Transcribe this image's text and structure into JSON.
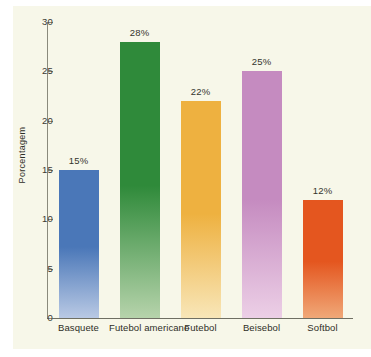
{
  "chart_data": {
    "type": "bar",
    "title": "",
    "subtitle": "",
    "xlabel": "",
    "ylabel": "Porcentagem",
    "ylim": [
      0,
      30
    ],
    "ytick_labels": [
      "0",
      "5",
      "10",
      "15",
      "20",
      "25",
      "30"
    ],
    "ytick_values": [
      0,
      5,
      10,
      15,
      20,
      25,
      30
    ],
    "grid": false,
    "legend": "none",
    "categories": [
      "Basquete",
      "Futebol americano",
      "Futebol",
      "Beisebol",
      "Softbol"
    ],
    "values": [
      15,
      28,
      22,
      25,
      12
    ],
    "data_labels": [
      "15%",
      "28%",
      "22%",
      "25%",
      "12%"
    ],
    "bar_colors": [
      "#4a77b8",
      "#2f8a3a",
      "#eeb140",
      "#c58bc0",
      "#e4561f"
    ],
    "bar_colors_bottom": [
      "#b9c9e4",
      "#b6d3ab",
      "#f8e6b8",
      "#eccfe6",
      "#f0a878"
    ],
    "background_color": "#f7f7e9",
    "page_color": "#ffffff",
    "axis_color": "#8a8a7c",
    "text_color": "#2e2e27"
  }
}
